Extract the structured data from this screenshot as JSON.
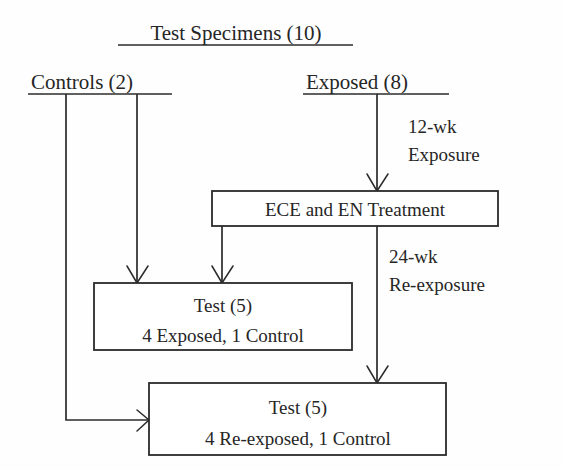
{
  "diagram": {
    "title": "Test Specimens (10)",
    "branches": {
      "left": "Controls (2)",
      "right": "Exposed (8)"
    },
    "edge_labels": {
      "first_exposure_line1": "12-wk",
      "first_exposure_line2": "Exposure",
      "reexposure_line1": "24-wk",
      "reexposure_line2": "Re-exposure"
    },
    "nodes": {
      "treatment": {
        "label": "ECE and EN Treatment"
      },
      "test_group_1": {
        "line1": "Test (5)",
        "line2": "4 Exposed, 1 Control"
      },
      "test_group_2": {
        "line1": "Test (5)",
        "line2": "4 Re-exposed, 1 Control"
      }
    },
    "colors": {
      "ink": "#2b2b2b",
      "text": "#262626",
      "background": "#fefefe",
      "box_fill": "#ffffff"
    }
  }
}
